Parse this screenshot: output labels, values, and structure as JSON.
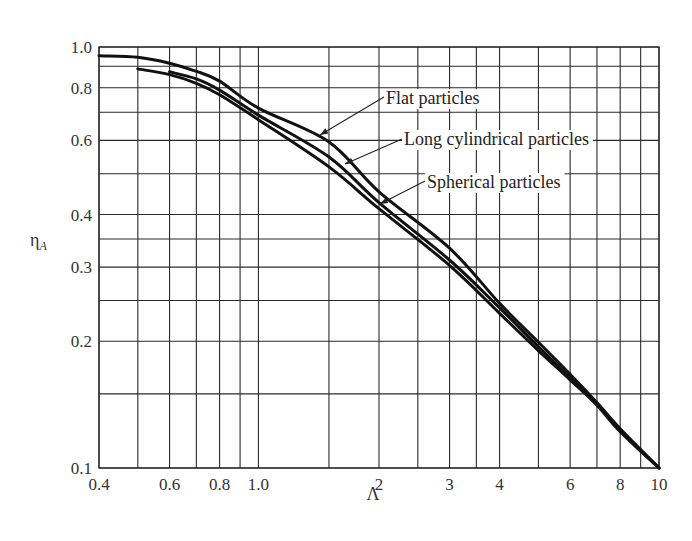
{
  "chart_data": {
    "type": "line",
    "title": "",
    "xlabel": "Λ",
    "ylabel": "η_A",
    "xscale": "log",
    "yscale": "log",
    "xlim": [
      0.4,
      10
    ],
    "ylim": [
      0.1,
      1.0
    ],
    "grid": true,
    "legend": "none (inline annotations with arrows)",
    "x_tick_labels": [
      "0.4",
      "0.6",
      "0.8",
      "1.0",
      "2",
      "3",
      "4",
      "6",
      "8",
      "10"
    ],
    "x_tick_values": [
      0.4,
      0.6,
      0.8,
      1.0,
      2,
      3,
      4,
      6,
      8,
      10
    ],
    "y_tick_labels": [
      "0.1",
      "0.2",
      "0.3",
      "0.4",
      "0.6",
      "0.8",
      "1.0"
    ],
    "y_tick_values": [
      0.1,
      0.2,
      0.3,
      0.4,
      0.6,
      0.8,
      1.0
    ],
    "x_gridlines": [
      0.4,
      0.5,
      0.6,
      0.7,
      0.8,
      0.9,
      1.0,
      1.5,
      2,
      2.5,
      3,
      3.5,
      4,
      5,
      6,
      7,
      8,
      9,
      10
    ],
    "y_gridlines": [
      0.1,
      0.15,
      0.2,
      0.25,
      0.3,
      0.35,
      0.4,
      0.5,
      0.6,
      0.7,
      0.8,
      0.9,
      1.0
    ],
    "series": [
      {
        "name": "Flat particles",
        "x": [
          0.4,
          0.5,
          0.6,
          0.7,
          0.8,
          1.0,
          1.5,
          2,
          3,
          4,
          5,
          6,
          7,
          8,
          10
        ],
        "y": [
          0.953,
          0.945,
          0.915,
          0.875,
          0.83,
          0.716,
          0.595,
          0.453,
          0.333,
          0.246,
          0.199,
          0.167,
          0.143,
          0.124,
          0.1
        ]
      },
      {
        "name": "Long cylindrical particles",
        "x": [
          0.6,
          0.7,
          0.8,
          1.0,
          1.5,
          2,
          3,
          4,
          5,
          6,
          7,
          8,
          10
        ],
        "y": [
          0.873,
          0.84,
          0.79,
          0.689,
          0.548,
          0.427,
          0.312,
          0.24,
          0.194,
          0.164,
          0.142,
          0.123,
          0.1
        ]
      },
      {
        "name": "Spherical particles",
        "x": [
          0.5,
          0.6,
          0.7,
          0.8,
          1.0,
          1.5,
          2,
          3,
          4,
          5,
          6,
          7,
          8,
          10
        ],
        "y": [
          0.887,
          0.86,
          0.82,
          0.77,
          0.672,
          0.519,
          0.413,
          0.303,
          0.233,
          0.19,
          0.162,
          0.141,
          0.122,
          0.1
        ]
      }
    ],
    "annotations": [
      {
        "text": "Flat particles",
        "text_x": 386,
        "text_y": 104,
        "arrow_from": [
          384,
          97
        ],
        "arrow_to": [
          320,
          135
        ]
      },
      {
        "text": "Long cylindrical particles",
        "text_x": 404,
        "text_y": 145,
        "arrow_from": [
          402,
          139
        ],
        "arrow_to": [
          345,
          164
        ]
      },
      {
        "text": "Spherical particles",
        "text_x": 427,
        "text_y": 188,
        "arrow_from": [
          425,
          181
        ],
        "arrow_to": [
          380,
          204
        ]
      }
    ]
  },
  "layout": {
    "plot_left": 99,
    "plot_right": 659,
    "plot_top": 47,
    "plot_bottom": 468
  },
  "labels": {
    "xlabel_display": "Λ",
    "ylabel_main": "η",
    "ylabel_sub": "A"
  }
}
